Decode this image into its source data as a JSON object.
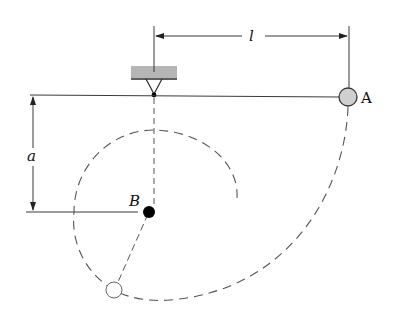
{
  "diagram": {
    "type": "pendulum-mechanics-figure",
    "labels": {
      "length": "l",
      "distance": "a",
      "point_a": "A",
      "point_b": "B"
    },
    "colors": {
      "line": "#3a3a3a",
      "ceiling_fill": "#b5b5b5",
      "bob_a_fill": "#cfcfcf",
      "peg_b_fill": "#000000",
      "background": "#ffffff"
    },
    "elements": [
      "fixed support (hatched ceiling)",
      "pivot point",
      "horizontal string to bob A",
      "dimension l from pivot to A",
      "dimension a from pivot to peg B",
      "peg B (solid dot)",
      "dashed vertical line below pivot",
      "dashed swing path of bob (large arc from A)",
      "dashed smaller circle about B",
      "bob final position (open circle)"
    ]
  }
}
